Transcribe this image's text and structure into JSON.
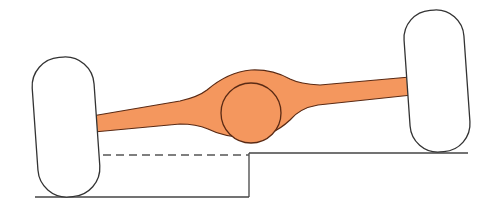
{
  "diagram": {
    "title": "",
    "colors": {
      "axle_fill": "#F4975E",
      "axle_stroke": "#5A2A14",
      "wheel_fill": "#FFFFFF",
      "wheel_stroke": "#333333",
      "ground_stroke": "#444444",
      "dashed_stroke": "#555555",
      "background": "#FFFFFF"
    },
    "elements": {
      "left_wheel": {
        "cx": 66,
        "cy": 127,
        "width": 62,
        "height": 140,
        "corner_radius": 30,
        "rotation_deg": -4
      },
      "right_wheel": {
        "cx": 437,
        "cy": 81,
        "width": 60,
        "height": 142,
        "corner_radius": 30,
        "rotation_deg": -4
      },
      "differential": {
        "cx": 251,
        "cy": 113,
        "r": 30
      },
      "upper_ground": {
        "x1": 249,
        "y1": 153,
        "x2": 468,
        "y2": 153
      },
      "lower_ground": {
        "x1": 35,
        "y1": 197,
        "x2": 249,
        "y2": 197
      },
      "step": {
        "x1": 249,
        "y1": 153,
        "x2": 249,
        "y2": 197
      },
      "dashed_reference": {
        "x1": 38,
        "y1": 155,
        "x2": 249,
        "y2": 155
      }
    },
    "labels": []
  }
}
